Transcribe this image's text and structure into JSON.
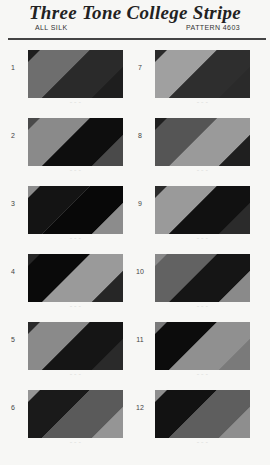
{
  "header": {
    "title": "Three Tone College Stripe",
    "left_label": "ALL SILK",
    "right_label": "PATTERN 4603"
  },
  "swatches": [
    {
      "number": "1",
      "caption": "~ ~ ~",
      "colors": [
        "#1e1e1e",
        "#6e6e6e",
        "#2a2a2a"
      ]
    },
    {
      "number": "2",
      "caption": "~ ~ ~",
      "colors": [
        "#4a4a4a",
        "#8a8a8a",
        "#0e0e0e"
      ]
    },
    {
      "number": "3",
      "caption": "~ ~ ~",
      "colors": [
        "#8c8c8c",
        "#141414",
        "#080808"
      ]
    },
    {
      "number": "4",
      "caption": "~ ~ ~",
      "colors": [
        "#262626",
        "#0a0a0a",
        "#9a9a9a"
      ]
    },
    {
      "number": "5",
      "caption": "~ ~ ~",
      "colors": [
        "#2a2a2a",
        "#8a8a8a",
        "#151515"
      ]
    },
    {
      "number": "6",
      "caption": "~ ~ ~",
      "colors": [
        "#959595",
        "#1a1a1a",
        "#5a5a5a"
      ]
    },
    {
      "number": "7",
      "caption": "~ ~ ~",
      "colors": [
        "#2a2a2a",
        "#a0a0a0",
        "#2e2e2e"
      ]
    },
    {
      "number": "8",
      "caption": "~ ~ ~",
      "colors": [
        "#1f1f1f",
        "#555555",
        "#9a9a9a"
      ]
    },
    {
      "number": "9",
      "caption": "~ ~ ~",
      "colors": [
        "#2b2b2b",
        "#9a9a9a",
        "#111111"
      ]
    },
    {
      "number": "10",
      "caption": "~ ~ ~",
      "colors": [
        "#8a8a8a",
        "#626262",
        "#151515"
      ]
    },
    {
      "number": "11",
      "caption": "~ ~ ~",
      "colors": [
        "#7a7a7a",
        "#0c0c0c",
        "#909090"
      ]
    },
    {
      "number": "12",
      "caption": "~ ~ ~",
      "colors": [
        "#8e8e8e",
        "#121212",
        "#5e5e5e"
      ]
    }
  ]
}
